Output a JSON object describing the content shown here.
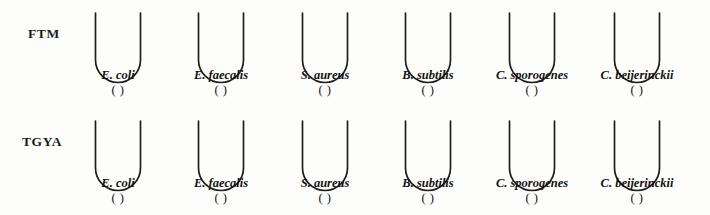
{
  "worksheet": {
    "tube_geometry": {
      "wall_height": 47,
      "tube_width": 45,
      "stroke_color": "#1d1d1d"
    },
    "rows": [
      {
        "media_label": "FTM",
        "media_label_name": "media-label-ftm",
        "tubes": [
          {
            "species": "E. coli",
            "result": "(    )",
            "center_x": 118
          },
          {
            "species": "E. faecalis",
            "result": "(    )",
            "center_x": 221
          },
          {
            "species": "S. aureus",
            "result": "(    )",
            "center_x": 325
          },
          {
            "species": "B. subtilis",
            "result": "(    )",
            "center_x": 428
          },
          {
            "species": "C. sporogenes",
            "result": "(    )",
            "center_x": 532
          },
          {
            "species": "C. beijerinckii",
            "result": "(    )",
            "center_x": 637
          }
        ]
      },
      {
        "media_label": "TGYA",
        "media_label_name": "media-label-tgya",
        "tubes": [
          {
            "species": "E. coli",
            "result": "(    )",
            "center_x": 118
          },
          {
            "species": "E. faecalis",
            "result": "(    )",
            "center_x": 221
          },
          {
            "species": "S. aureus",
            "result": "(    )",
            "center_x": 325
          },
          {
            "species": "B. subtilis",
            "result": "(    )",
            "center_x": 428
          },
          {
            "species": "C. sporogenes",
            "result": "(    )",
            "center_x": 532
          },
          {
            "species": "C. beijerinckii",
            "result": "(    )",
            "center_x": 637
          }
        ]
      }
    ]
  }
}
